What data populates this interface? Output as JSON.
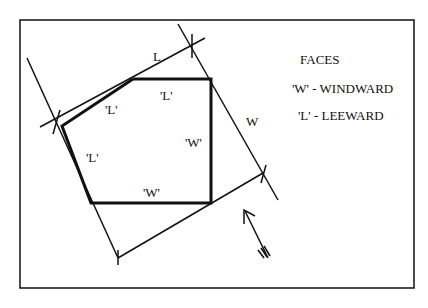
{
  "diagram": {
    "colors": {
      "line": "#111111",
      "background": "#ffffff"
    },
    "dimension_labels": {
      "length": "L",
      "width": "W"
    },
    "face_labels": {
      "top_diagonal": "'L'",
      "top_horizontal": "'L'",
      "left_side": "'L'",
      "right_vertical": "'W'",
      "bottom_horizontal": "'W'"
    },
    "legend": {
      "title": "FACES",
      "items": [
        {
          "key": "'W'",
          "text": "'W' - WINDWARD"
        },
        {
          "key": "'L'",
          "text": "'L' - LEEWARD"
        }
      ]
    },
    "wind_arrow": {
      "icon": "wind-direction-arrow"
    }
  }
}
